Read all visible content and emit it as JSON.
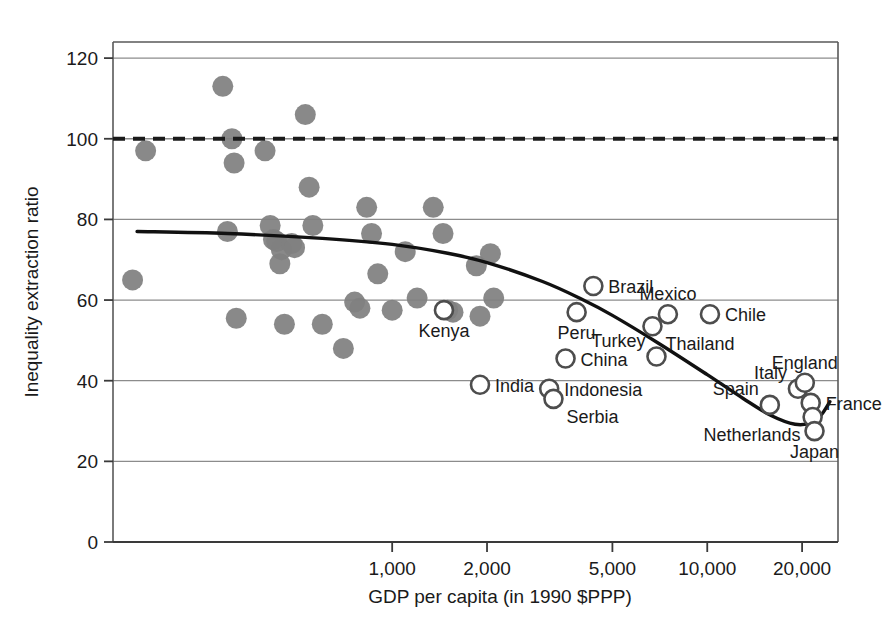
{
  "chart_data": {
    "type": "scatter",
    "title": "",
    "xlabel": "GDP per capita (in 1990 $PPP)",
    "ylabel": "Inequality extraction ratio",
    "xscale": "log",
    "xlim": [
      130,
      26000
    ],
    "ylim": [
      0,
      124
    ],
    "xticks": [
      1000,
      2000,
      5000,
      10000,
      20000
    ],
    "xtick_labels": [
      "1,000",
      "2,000",
      "5,000",
      "10,000",
      "20,000"
    ],
    "yticks": [
      0,
      20,
      40,
      60,
      80,
      100,
      120
    ],
    "ytick_labels": [
      "0",
      "20",
      "40",
      "60",
      "80",
      "100",
      "120"
    ],
    "grid": "horizontal",
    "legend": "none",
    "reference_line": {
      "y": 100,
      "style": "dashed",
      "color": "#1a1a1a"
    },
    "fit_curve": {
      "style": "solid",
      "color": "#111111",
      "description": "cubic trend of inequality extraction ratio vs log GDP per capita",
      "points": [
        {
          "x": 155,
          "y": 77.0
        },
        {
          "x": 300,
          "y": 76.5
        },
        {
          "x": 600,
          "y": 75.3
        },
        {
          "x": 1000,
          "y": 73.8
        },
        {
          "x": 1500,
          "y": 71.6
        },
        {
          "x": 2000,
          "y": 69.3
        },
        {
          "x": 3000,
          "y": 64.6
        },
        {
          "x": 4000,
          "y": 60.2
        },
        {
          "x": 5000,
          "y": 56.2
        },
        {
          "x": 7000,
          "y": 49.3
        },
        {
          "x": 10000,
          "y": 41.5
        },
        {
          "x": 13000,
          "y": 35.6
        },
        {
          "x": 16000,
          "y": 31.3
        },
        {
          "x": 19000,
          "y": 29.2
        },
        {
          "x": 21500,
          "y": 29.6
        },
        {
          "x": 23000,
          "y": 31.5
        },
        {
          "x": 24500,
          "y": 34.8
        }
      ]
    },
    "series": [
      {
        "name": "Pre-industrial / historical societies",
        "marker": "filled-circle",
        "color": "#808080",
        "points": [
          {
            "x": 150,
            "y": 65.0
          },
          {
            "x": 165,
            "y": 97.0
          },
          {
            "x": 290,
            "y": 113.0
          },
          {
            "x": 300,
            "y": 77.0
          },
          {
            "x": 310,
            "y": 100.0
          },
          {
            "x": 315,
            "y": 94.0
          },
          {
            "x": 320,
            "y": 55.5
          },
          {
            "x": 395,
            "y": 97.0
          },
          {
            "x": 410,
            "y": 78.5
          },
          {
            "x": 420,
            "y": 75.0
          },
          {
            "x": 430,
            "y": 74.5
          },
          {
            "x": 440,
            "y": 69.0
          },
          {
            "x": 445,
            "y": 72.5
          },
          {
            "x": 455,
            "y": 54.0
          },
          {
            "x": 480,
            "y": 74.0
          },
          {
            "x": 490,
            "y": 73.0
          },
          {
            "x": 530,
            "y": 106.0
          },
          {
            "x": 545,
            "y": 88.0
          },
          {
            "x": 560,
            "y": 78.5
          },
          {
            "x": 600,
            "y": 54.0
          },
          {
            "x": 700,
            "y": 48.0
          },
          {
            "x": 760,
            "y": 59.5
          },
          {
            "x": 790,
            "y": 58.0
          },
          {
            "x": 830,
            "y": 83.0
          },
          {
            "x": 860,
            "y": 76.5
          },
          {
            "x": 900,
            "y": 66.5
          },
          {
            "x": 1000,
            "y": 57.5
          },
          {
            "x": 1100,
            "y": 72.0
          },
          {
            "x": 1200,
            "y": 60.5
          },
          {
            "x": 1350,
            "y": 83.0
          },
          {
            "x": 1450,
            "y": 76.5
          },
          {
            "x": 1500,
            "y": 57.5
          },
          {
            "x": 1560,
            "y": 57.0
          },
          {
            "x": 1850,
            "y": 68.5
          },
          {
            "x": 1900,
            "y": 56.0
          },
          {
            "x": 2050,
            "y": 71.5
          },
          {
            "x": 2100,
            "y": 60.5
          }
        ]
      },
      {
        "name": "Modern countries (circa 2000)",
        "marker": "open-circle",
        "color": "#4d4d4d",
        "points": [
          {
            "x": 1460,
            "y": 57.5,
            "label": "Kenya",
            "label_pos": "below"
          },
          {
            "x": 1900,
            "y": 39.0,
            "label": "India",
            "label_pos": "right"
          },
          {
            "x": 3150,
            "y": 38.0,
            "label": "Indonesia",
            "label_pos": "right"
          },
          {
            "x": 3250,
            "y": 35.5,
            "label": "Serbia",
            "label_pos": "below-right"
          },
          {
            "x": 3550,
            "y": 45.5,
            "label": "China",
            "label_pos": "right"
          },
          {
            "x": 3850,
            "y": 57.0,
            "label": "Peru",
            "label_pos": "below"
          },
          {
            "x": 4350,
            "y": 63.5,
            "label": "Brazil",
            "label_pos": "right"
          },
          {
            "x": 6700,
            "y": 53.5,
            "label": "Thailand",
            "label_pos": "below-right"
          },
          {
            "x": 6900,
            "y": 46.0,
            "label": "Turkey",
            "label_pos": "above-left"
          },
          {
            "x": 7500,
            "y": 56.5,
            "label": "Mexico",
            "label_pos": "above"
          },
          {
            "x": 10200,
            "y": 56.5,
            "label": "Chile",
            "label_pos": "right"
          },
          {
            "x": 15800,
            "y": 34.0,
            "label": "Spain",
            "label_pos": "above-left"
          },
          {
            "x": 19400,
            "y": 38.0,
            "label": "Italy",
            "label_pos": "above-left"
          },
          {
            "x": 20400,
            "y": 39.5,
            "label": "England",
            "label_pos": "above"
          },
          {
            "x": 21300,
            "y": 34.5,
            "label": "France",
            "label_pos": "right"
          },
          {
            "x": 21600,
            "y": 31.0,
            "label": "Netherlands",
            "label_pos": "below-left"
          },
          {
            "x": 21900,
            "y": 27.5,
            "label": "Japan",
            "label_pos": "below"
          }
        ]
      }
    ]
  }
}
